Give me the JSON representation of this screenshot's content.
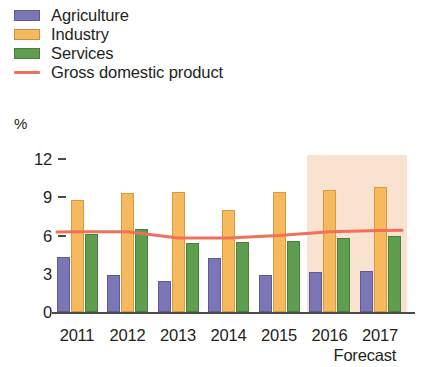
{
  "legend": {
    "items": [
      {
        "label": "Agriculture",
        "color": "#7b76b6",
        "marker": "swatch"
      },
      {
        "label": "Industry",
        "color": "#f7b95e",
        "marker": "swatch"
      },
      {
        "label": "Services",
        "color": "#5f9e4e",
        "marker": "swatch"
      },
      {
        "label": "Gross domestic product",
        "color": "#f0705a",
        "marker": "line"
      }
    ]
  },
  "axes": {
    "unit_label": "%",
    "y_ticks": [
      "12",
      "9",
      "6",
      "3",
      "0"
    ],
    "x_ticks": [
      "2011",
      "2012",
      "2013",
      "2014",
      "2015",
      "2016",
      "2017"
    ],
    "forecast_caption": "Forecast"
  },
  "chart_data": {
    "type": "bar",
    "title": "",
    "subtitle": "",
    "xlabel": "",
    "ylabel": "%",
    "ylim": [
      0,
      12
    ],
    "y_ticks": [
      0,
      3,
      6,
      9,
      12
    ],
    "grid": false,
    "legend_position": "top-left",
    "categories": [
      "2011",
      "2012",
      "2013",
      "2014",
      "2015",
      "2016",
      "2017"
    ],
    "series": [
      {
        "name": "Agriculture",
        "type": "bar",
        "color": "#7b76b6",
        "values": [
          4.3,
          2.9,
          2.4,
          4.2,
          2.9,
          3.1,
          3.2
        ]
      },
      {
        "name": "Industry",
        "type": "bar",
        "color": "#f7b95e",
        "values": [
          8.8,
          9.3,
          9.4,
          8.0,
          9.4,
          9.6,
          9.8
        ]
      },
      {
        "name": "Services",
        "type": "bar",
        "color": "#5f9e4e",
        "values": [
          6.1,
          6.5,
          5.4,
          5.5,
          5.6,
          5.8,
          6.0
        ]
      },
      {
        "name": "Gross domestic product",
        "type": "line",
        "color": "#f0705a",
        "values": [
          6.3,
          6.3,
          5.8,
          5.8,
          6.0,
          6.3,
          6.4
        ]
      }
    ],
    "annotations": [
      {
        "label": "Forecast",
        "span": [
          "2016",
          "2017"
        ],
        "shading_color": "#f9dfcb"
      }
    ]
  }
}
